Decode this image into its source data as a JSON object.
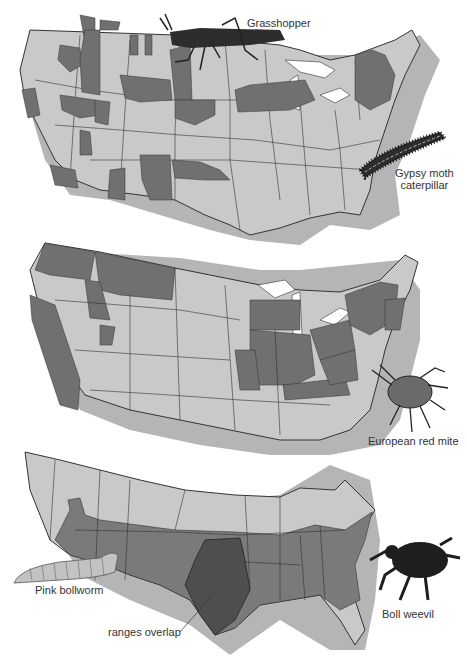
{
  "figure": {
    "maps": [
      {
        "id": "map-1",
        "pests": [
          "Grasshopper",
          "Gypsy moth caterpillar"
        ]
      },
      {
        "id": "map-2",
        "pests": [
          "European red mite"
        ]
      },
      {
        "id": "map-3",
        "pests": [
          "Pink bollworm",
          "Boll weevil"
        ],
        "annotation": "ranges overlap"
      }
    ],
    "labels": {
      "grasshopper": "Grasshopper",
      "gypsy_line1": "Gypsy moth",
      "gypsy_line2": "caterpillar",
      "mite": "European red mite",
      "bollworm": "Pink bollworm",
      "weevil": "Boll weevil",
      "overlap": "ranges overlap"
    },
    "colors": {
      "state_fill": "#c9c9c9",
      "range_fill": "#707070",
      "overlap_fill": "#4e4e4e",
      "shadow": "#b5b5b5",
      "border": "#333333",
      "insect": "#2a2a2a"
    }
  }
}
